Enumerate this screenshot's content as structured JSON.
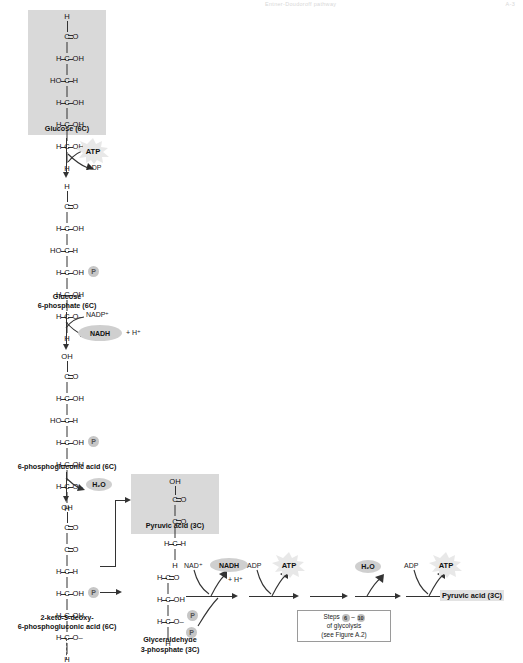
{
  "header": {
    "running_title": "Entner-Doudoroff pathway",
    "page_number": "A-3"
  },
  "diagram": {
    "title": "Entner-Doudoroff pathway",
    "molecules": [
      {
        "id": "glucose",
        "label": "Glucose (6C)",
        "carbons": [
          "6C"
        ],
        "rows": [
          "H",
          "C=O",
          "H—C—OH",
          "HO—C—H",
          "H—C—OH",
          "H—C—OH",
          "H—C—OH",
          "H"
        ],
        "top": "H",
        "units": [
          {
            "left": "",
            "center": "C",
            "right": "O",
            "right_bond": "double"
          },
          {
            "left": "H",
            "center": "C",
            "right": "OH",
            "right_bond": "single"
          },
          {
            "left": "HO",
            "center": "C",
            "right": "H",
            "right_bond": "single"
          },
          {
            "left": "H",
            "center": "C",
            "right": "OH",
            "right_bond": "single"
          },
          {
            "left": "H",
            "center": "C",
            "right": "OH",
            "right_bond": "single"
          },
          {
            "left": "H",
            "center": "C",
            "right": "OH",
            "right_bond": "single"
          }
        ],
        "bottom": "H",
        "shaded": true
      },
      {
        "id": "glucose-6-phosphate",
        "label": "Glucose\n6-phosphate (6C)",
        "label_line1": "Glucose",
        "label_line2": "6-phosphate (6C)",
        "top": "H",
        "units": [
          {
            "left": "",
            "center": "C",
            "right": "O",
            "right_bond": "double"
          },
          {
            "left": "H",
            "center": "C",
            "right": "OH",
            "right_bond": "single"
          },
          {
            "left": "HO",
            "center": "C",
            "right": "H",
            "right_bond": "single"
          },
          {
            "left": "H",
            "center": "C",
            "right": "OH",
            "right_bond": "single"
          },
          {
            "left": "H",
            "center": "C",
            "right": "OH",
            "right_bond": "single"
          },
          {
            "left": "H",
            "center": "C",
            "right": "O–",
            "right_bond": "single",
            "phosphate": "P"
          }
        ],
        "bottom": "H",
        "shaded": false
      },
      {
        "id": "6-phosphogluconic-acid",
        "label": "6-phosphogluconic acid (6C)",
        "top": "OH",
        "units": [
          {
            "left": "",
            "center": "C",
            "right": "O",
            "right_bond": "double"
          },
          {
            "left": "H",
            "center": "C",
            "right": "OH",
            "right_bond": "single"
          },
          {
            "left": "HO",
            "center": "C",
            "right": "H",
            "right_bond": "single"
          },
          {
            "left": "H",
            "center": "C",
            "right": "OH",
            "right_bond": "single"
          },
          {
            "left": "H",
            "center": "C",
            "right": "OH",
            "right_bond": "single"
          },
          {
            "left": "H",
            "center": "C",
            "right": "O–",
            "right_bond": "single",
            "phosphate": "P"
          }
        ],
        "bottom": "H",
        "shaded": false
      },
      {
        "id": "2-keto-3-deoxy-6-phosphogluconic-acid",
        "label_line1": "2-keto-3-deoxy-",
        "label_line2": "6-phosphogluconic acid (6C)",
        "top": "OH",
        "units": [
          {
            "left": "",
            "center": "C",
            "right": "O",
            "right_bond": "double"
          },
          {
            "left": "",
            "center": "C",
            "right": "O",
            "right_bond": "double"
          },
          {
            "left": "H",
            "center": "C",
            "right": "H",
            "right_bond": "single"
          },
          {
            "left": "H",
            "center": "C",
            "right": "OH",
            "right_bond": "single"
          },
          {
            "left": "H",
            "center": "C",
            "right": "OH",
            "right_bond": "single"
          },
          {
            "left": "H",
            "center": "C",
            "right": "O–",
            "right_bond": "single",
            "phosphate": "P"
          }
        ],
        "bottom": "H",
        "shaded": false
      },
      {
        "id": "pyruvic-acid-box",
        "label": "Pyruvic acid (3C)",
        "top": "OH",
        "units": [
          {
            "left": "",
            "center": "C",
            "right": "O",
            "right_bond": "double"
          },
          {
            "left": "",
            "center": "C",
            "right": "O",
            "right_bond": "double"
          },
          {
            "left": "H",
            "center": "C",
            "right": "H",
            "right_bond": "single"
          }
        ],
        "bottom": "H",
        "shaded": true
      },
      {
        "id": "glyceraldehyde-3-phosphate",
        "label_line1": "Glyceraldehyde",
        "label_line2": "3-phosphate (3C)",
        "top": "",
        "units": [
          {
            "left": "H",
            "center": "C",
            "right": "O",
            "right_bond": "double"
          },
          {
            "left": "H",
            "center": "C",
            "right": "OH",
            "right_bond": "single"
          },
          {
            "left": "H",
            "center": "C",
            "right": "O–",
            "right_bond": "single",
            "phosphate": "P"
          }
        ],
        "bottom": "H",
        "shaded": false
      }
    ],
    "cofactors": {
      "atp_1_in": "ATP",
      "adp_1_out": "ADP",
      "nadp_in": "NADP⁺",
      "nadph_out": "NADH",
      "nadph_plus_h": "+ H⁺",
      "water_out_1": "H₂O",
      "nad_in": "NAD⁺",
      "nadh_out": "NADH",
      "nadh_plus_h": "+ H⁺",
      "adp_in_2": "ADP",
      "atp_out_2": "ATP",
      "water_out_2": "H₂O",
      "adp_in_3": "ADP",
      "atp_out_3": "ATP",
      "phosphate_in": "P"
    },
    "phosphate_symbol": "P",
    "final_product": "Pyruvic acid (3C)",
    "steps_note": {
      "prefix": "Steps",
      "from_step": "6",
      "dash": "–",
      "to_step": "10",
      "line2": "of glycolysis",
      "line3": "(see Figure A.2)"
    }
  },
  "colors": {
    "shade": "#d9d9d9",
    "oval": "#cfcfcf",
    "phosphate": "#c6c6c6",
    "line": "#333333",
    "burst": "#e6e6e6"
  }
}
